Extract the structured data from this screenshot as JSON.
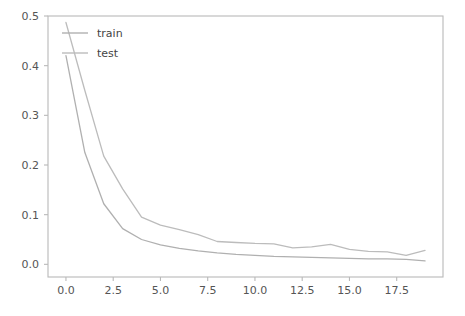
{
  "chart_data": {
    "type": "line",
    "title": "",
    "xlabel": "",
    "ylabel": "",
    "xlim": [
      -0.95,
      19.95
    ],
    "ylim": [
      -0.0255,
      0.5
    ],
    "grid": false,
    "legend_position": "upper-left",
    "legend_frame": false,
    "background": "#ffffff",
    "x": [
      0,
      1,
      2,
      3,
      4,
      5,
      6,
      7,
      8,
      9,
      10,
      11,
      12,
      13,
      14,
      15,
      16,
      17,
      18,
      19
    ],
    "xticks": [
      0.0,
      2.5,
      5.0,
      7.5,
      10.0,
      12.5,
      15.0,
      17.5
    ],
    "xticklabels": [
      "0.0",
      "2.5",
      "5.0",
      "7.5",
      "10.0",
      "12.5",
      "15.0",
      "17.5"
    ],
    "yticks": [
      0.0,
      0.1,
      0.2,
      0.3,
      0.4,
      0.5
    ],
    "yticklabels": [
      "0.0",
      "0.1",
      "0.2",
      "0.3",
      "0.4",
      "0.5"
    ],
    "series": [
      {
        "name": "train",
        "color": "#b0b0b0",
        "values": [
          0.42,
          0.225,
          0.122,
          0.072,
          0.05,
          0.039,
          0.032,
          0.027,
          0.023,
          0.02,
          0.018,
          0.016,
          0.015,
          0.014,
          0.013,
          0.012,
          0.011,
          0.011,
          0.01,
          0.007
        ]
      },
      {
        "name": "test",
        "color": "#bcbcbc",
        "values": [
          0.487,
          0.35,
          0.218,
          0.152,
          0.095,
          0.079,
          0.07,
          0.06,
          0.046,
          0.044,
          0.042,
          0.041,
          0.033,
          0.035,
          0.04,
          0.03,
          0.026,
          0.025,
          0.018,
          0.028
        ]
      }
    ]
  },
  "legend": {
    "entries": [
      {
        "label": "train"
      },
      {
        "label": "test"
      }
    ]
  },
  "axes": {
    "spine_color": "#b9b9b9",
    "tick_color": "#555555"
  }
}
